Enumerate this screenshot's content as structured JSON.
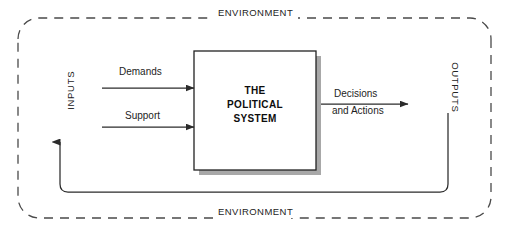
{
  "diagram": {
    "title": "The Political System",
    "type": "systems-model-flow-diagram",
    "boundary": {
      "style": "dashed-rounded-rectangle",
      "label_top": "ENVIRONMENT",
      "label_bottom": "ENVIRONMENT"
    },
    "center_box": {
      "line1": "THE",
      "line2": "POLITICAL",
      "line3": "SYSTEM",
      "fill": "#ffffff",
      "border_color": "#222222",
      "shadow_color": "#a8a8a8"
    },
    "inputs": {
      "axis_label": "INPUTS",
      "arrows": [
        {
          "label": "Demands"
        },
        {
          "label": "Support"
        }
      ]
    },
    "outputs": {
      "axis_label": "OUTPUTS",
      "arrows": [
        {
          "label_line1": "Decisions",
          "label_line2": "and Actions"
        }
      ]
    },
    "feedback_loop": {
      "description": "feedback-line-from-outputs-to-inputs",
      "arrow_direction": "up"
    },
    "colors": {
      "line": "#2b2b2b",
      "dashed_boundary": "#4a4a4a",
      "text": "#1a1a1a",
      "background": "#ffffff"
    }
  }
}
